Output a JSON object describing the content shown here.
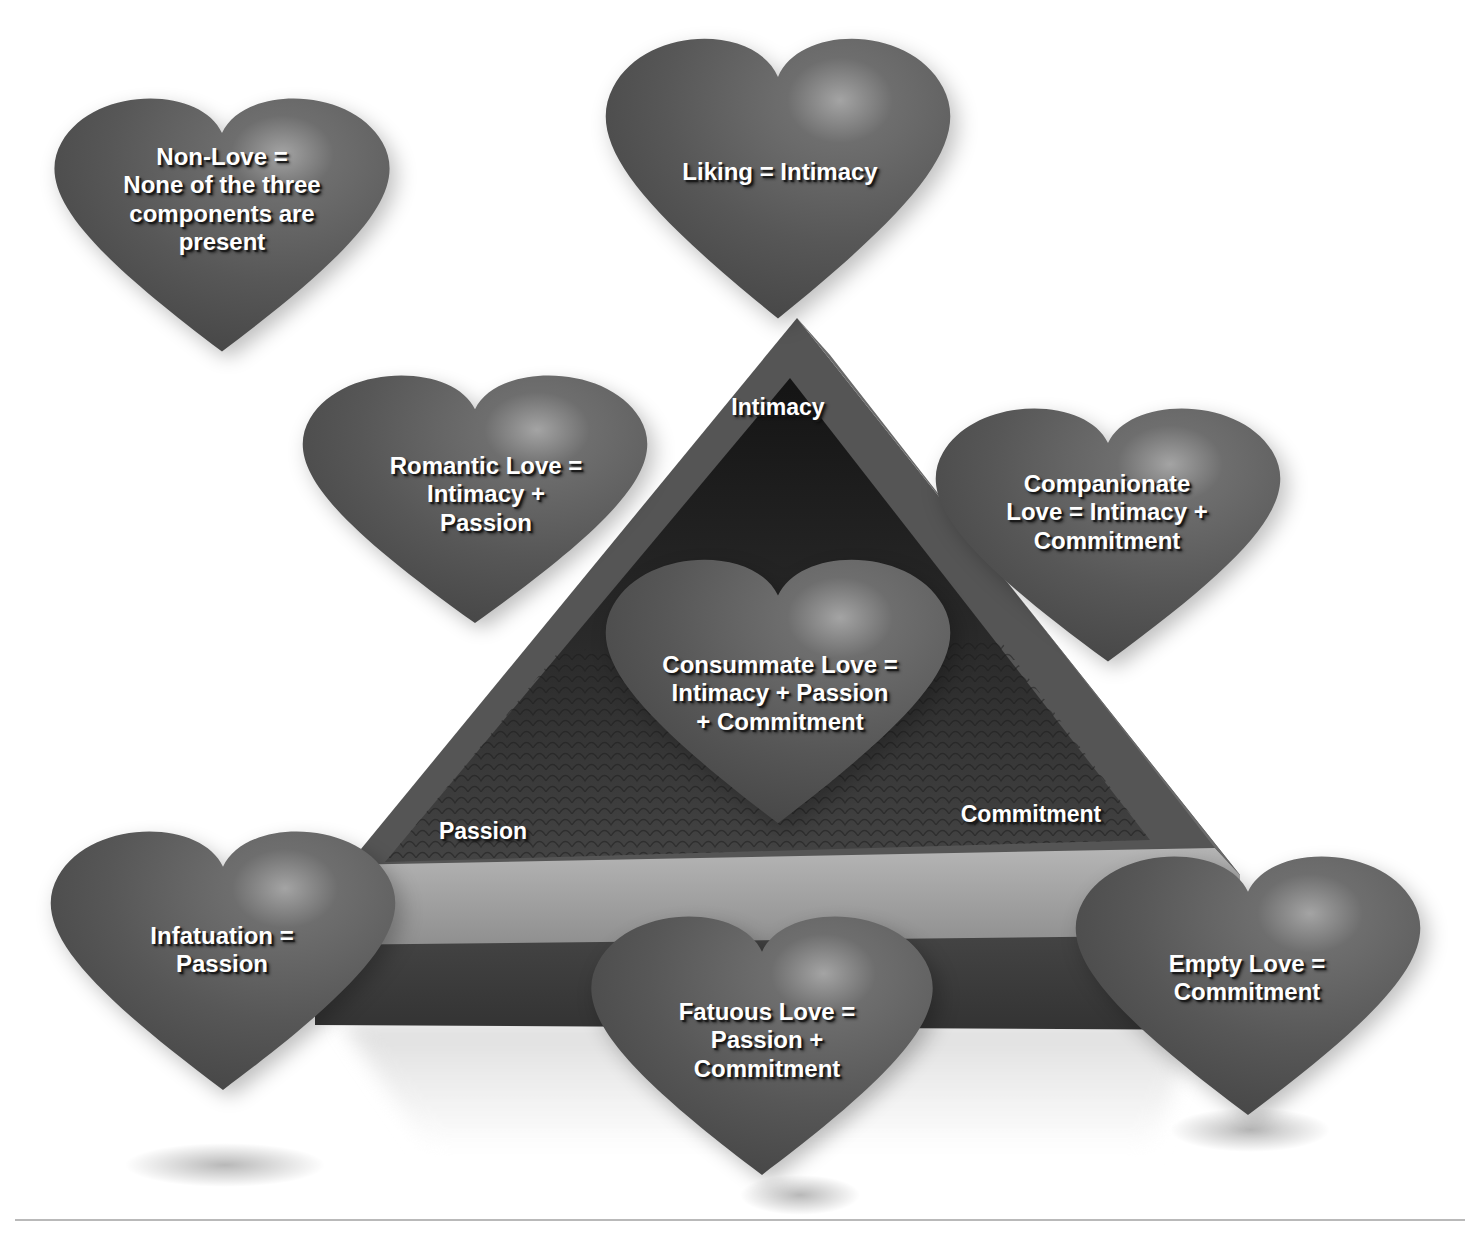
{
  "diagram": {
    "colors": {
      "heart_fill": "#5a5a5a",
      "heart_highlight": "#9a9a9a",
      "pyramid_face": "#575757",
      "pyramid_inner": "#222222",
      "pyramid_floor": "#3c3c3c",
      "pyramid_ledge": "#a8a8a8",
      "pyramid_base_front": "#4a4a4a",
      "label_text": "#ffffff",
      "rule": "#b9b9b9"
    },
    "vertices": {
      "top": "Intimacy",
      "left": "Passion",
      "right": "Commitment"
    },
    "hearts": [
      {
        "id": "non-love",
        "lines": [
          "Non-Love =",
          "None of the three",
          "components are",
          "present"
        ]
      },
      {
        "id": "liking",
        "lines": [
          "Liking = Intimacy"
        ]
      },
      {
        "id": "romantic-love",
        "lines": [
          "Romantic Love =",
          "Intimacy +",
          "Passion"
        ]
      },
      {
        "id": "companionate-love",
        "lines": [
          "Companionate",
          "Love = Intimacy +",
          "Commitment"
        ]
      },
      {
        "id": "consummate-love",
        "lines": [
          "Consummate Love =",
          "Intimacy + Passion",
          "+ Commitment"
        ]
      },
      {
        "id": "infatuation",
        "lines": [
          "Infatuation =",
          "Passion"
        ]
      },
      {
        "id": "fatuous-love",
        "lines": [
          "Fatuous Love =",
          "Passion +",
          "Commitment"
        ]
      },
      {
        "id": "empty-love",
        "lines": [
          "Empty Love =",
          "Commitment"
        ]
      }
    ]
  }
}
